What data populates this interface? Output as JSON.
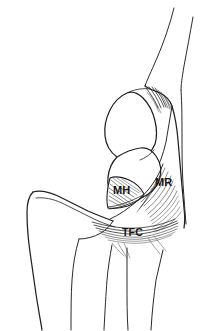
{
  "figure": {
    "background_color": "#ffffff",
    "ink_color": "#231f20",
    "width": 202,
    "height": 331
  },
  "labels": [
    {
      "id": "mh",
      "text": "MH",
      "meaning": "meniscus homologue",
      "x": 113,
      "y": 194
    },
    {
      "id": "mr",
      "text": "MR",
      "meaning": "radioulnar ligament / ulnar collateral region",
      "x": 155,
      "y": 186
    },
    {
      "id": "tfc",
      "text": "TFC",
      "meaning": "triangular fibrocartilage",
      "x": 122,
      "y": 236
    }
  ],
  "structures": [
    {
      "id": "ulna-shaft",
      "name": "ulna shaft",
      "position": "upper right"
    },
    {
      "id": "ulnar-head",
      "name": "ulnar head",
      "position": "right middle"
    },
    {
      "id": "lunate",
      "name": "lunate",
      "position": "center upper"
    },
    {
      "id": "triquetrum",
      "name": "triquetrum",
      "position": "center"
    },
    {
      "id": "radius",
      "name": "distal radius",
      "position": "left"
    },
    {
      "id": "metacarpal-shadows",
      "name": "distal bone shafts",
      "position": "bottom"
    },
    {
      "id": "tfcc-fibers",
      "name": "triangular fibrocartilage complex fibers",
      "position": "center lower"
    }
  ]
}
